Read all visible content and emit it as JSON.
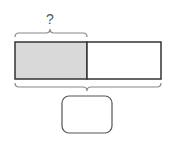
{
  "diagram": {
    "type": "tape-diagram",
    "question_label": "?",
    "answer_box_value": "",
    "bar": {
      "segments": [
        {
          "name": "shaded-part",
          "fill": "#d9d9d9"
        },
        {
          "name": "unshaded-part",
          "fill": "#ffffff"
        }
      ]
    },
    "colors": {
      "stroke": "#333333",
      "brace": "#888888",
      "shade": "#d9d9d9"
    }
  }
}
